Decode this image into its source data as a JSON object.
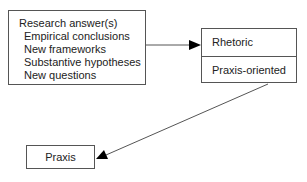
{
  "diagram": {
    "nodes": {
      "research": {
        "title": "Research answer(s)",
        "items": [
          "Empirical conclusions",
          "New frameworks",
          "Substantive hypotheses",
          "New questions"
        ]
      },
      "rhetoric": {
        "cells": [
          "Rhetoric",
          "Praxis-oriented"
        ]
      },
      "praxis": {
        "label": "Praxis"
      }
    },
    "edges": [
      {
        "from": "research",
        "to": "rhetoric"
      },
      {
        "from": "rhetoric.praxis-oriented",
        "to": "praxis"
      }
    ],
    "colors": {
      "line": "#555555",
      "arrowhead": "#000000"
    }
  }
}
